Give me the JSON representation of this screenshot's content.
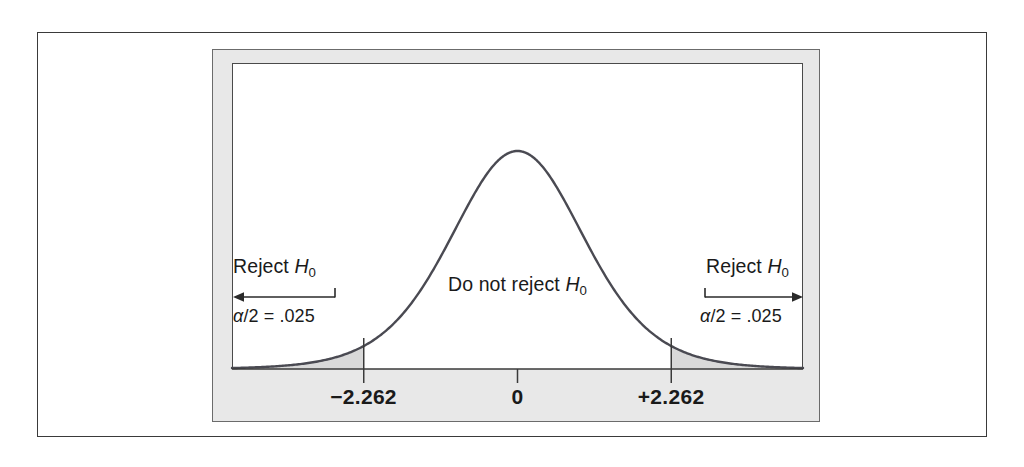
{
  "figure": {
    "type": "statistical-distribution-figure"
  },
  "labels": {
    "reject_left": "Reject",
    "reject_left_symbol": "H",
    "reject_left_subscript": "0",
    "reject_right": "Reject",
    "reject_right_symbol": "H",
    "reject_right_subscript": "0",
    "do_not_reject": "Do not reject",
    "do_not_reject_symbol": "H",
    "do_not_reject_subscript": "0",
    "alpha_left_symbol": "α",
    "alpha_left_text": "/2 = .025",
    "alpha_right_symbol": "α",
    "alpha_right_text": "/2 = .025"
  },
  "axis": {
    "ticks": [
      {
        "label": "−2.262",
        "value": -2.262
      },
      {
        "label": "0",
        "value": 0
      },
      {
        "label": "+2.262",
        "value": 2.262
      }
    ]
  },
  "colors": {
    "curve": "#4a4a52",
    "shade": "#d9d9d9",
    "frame_gray": "#e8e8e8",
    "frame_border": "#6b6b6b",
    "outer_border": "#3a3a3a",
    "text": "#1a1a1a",
    "baseline": "#3a3a3a"
  },
  "chart_data": {
    "type": "line",
    "title": "",
    "xlabel": "",
    "ylabel": "",
    "distribution": "t",
    "degrees_of_freedom": 9,
    "xlim": [
      -4.2,
      4.2
    ],
    "ylim": [
      0,
      0.42
    ],
    "grid": false,
    "legend": null,
    "critical_values": [
      -2.262,
      2.262
    ],
    "tail_area_each": 0.025,
    "total_alpha": 0.05,
    "center": 0,
    "peak_density": 0.4,
    "x": [
      -4.2,
      -3.8,
      -3.4,
      -3.0,
      -2.6,
      -2.262,
      -2.0,
      -1.6,
      -1.2,
      -0.8,
      -0.4,
      0,
      0.4,
      0.8,
      1.2,
      1.6,
      2.0,
      2.262,
      2.6,
      3.0,
      3.4,
      3.8,
      4.2
    ],
    "y": [
      0.006,
      0.01,
      0.017,
      0.028,
      0.047,
      0.063,
      0.081,
      0.128,
      0.192,
      0.266,
      0.34,
      0.387,
      0.34,
      0.266,
      0.192,
      0.128,
      0.081,
      0.063,
      0.047,
      0.028,
      0.017,
      0.01,
      0.006
    ],
    "annotations": [
      {
        "text": "Reject H0",
        "region": "left-tail"
      },
      {
        "text": "Do not reject H0",
        "region": "center"
      },
      {
        "text": "Reject H0",
        "region": "right-tail"
      },
      {
        "text": "alpha/2 = .025",
        "region": "left-tail"
      },
      {
        "text": "alpha/2 = .025",
        "region": "right-tail"
      }
    ]
  }
}
